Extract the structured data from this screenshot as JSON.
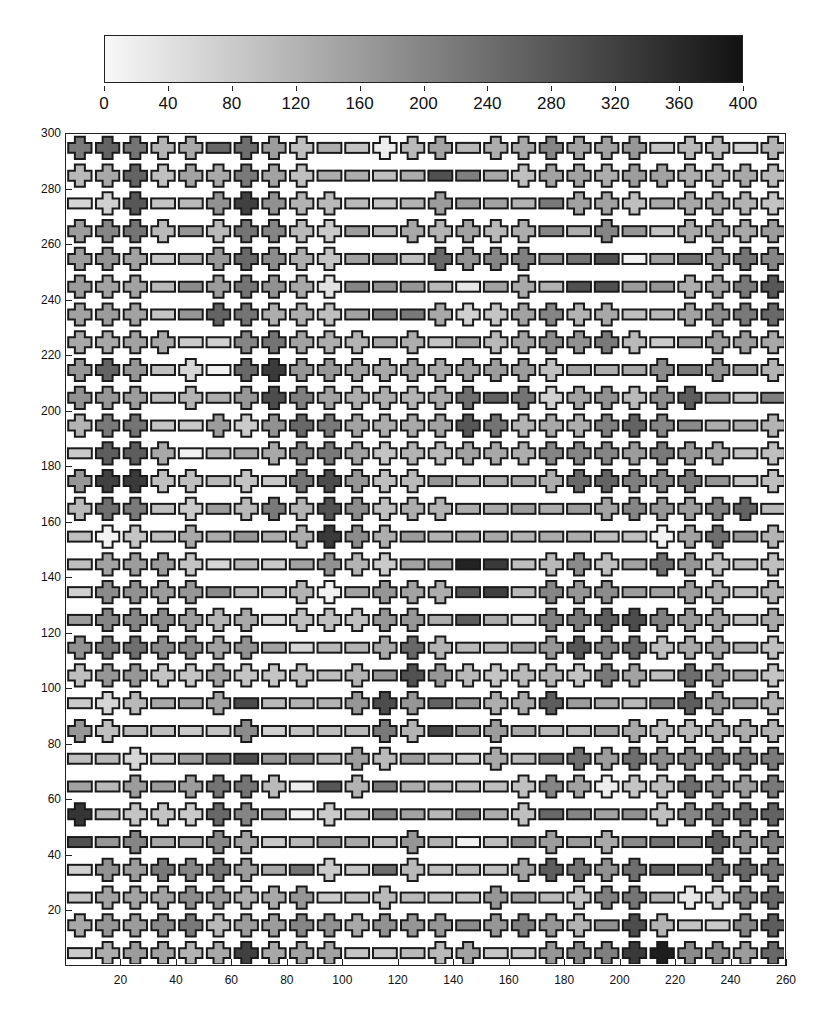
{
  "chart_data": {
    "type": "heatmap",
    "title": "",
    "subtitle": "",
    "xlabel": "",
    "ylabel": "",
    "colorbar": {
      "min": 0,
      "max": 400,
      "ticks": [
        0,
        40,
        80,
        120,
        160,
        200,
        240,
        280,
        320,
        360,
        400
      ],
      "colormap": "white-to-black (halftone gray)",
      "position": "top"
    },
    "x_axis": {
      "range": [
        0,
        260
      ],
      "ticks": [
        20,
        40,
        60,
        80,
        100,
        120,
        140,
        160,
        180,
        200,
        220,
        240,
        260
      ]
    },
    "y_axis": {
      "range": [
        0,
        300
      ],
      "ticks": [
        20,
        40,
        60,
        80,
        100,
        120,
        140,
        160,
        180,
        200,
        220,
        240,
        260,
        280,
        300
      ]
    },
    "grid": false,
    "legend": "none (glyph shape encodes category: c = cross/plus, b = horizontal bar; fill shade encodes value 0-400)",
    "x_centers": [
      5,
      15,
      25,
      35,
      45,
      55,
      65,
      75,
      85,
      95,
      105,
      115,
      125,
      135,
      145,
      155,
      165,
      175,
      185,
      195,
      205,
      215,
      225,
      235,
      245,
      255
    ],
    "y_centers_top_to_bottom": [
      295,
      285,
      275,
      265,
      255,
      245,
      235,
      225,
      215,
      205,
      195,
      185,
      175,
      165,
      155,
      145,
      135,
      125,
      115,
      105,
      95,
      85,
      75,
      65,
      55,
      45,
      35,
      25,
      15,
      5
    ],
    "rows_types": [
      "cccccbcccbbcccbccccccbccbc",
      "cccccccccbbbbbbbccccccccccc",
      "bccbbcccccbbbcbbbbcccbccccb",
      "ccccbcccccbbcccccbbcbbcccc",
      "cccbbcccccbbbccccbbbbbbcccc",
      "cccbbcccccbbbbbbcbbbbbcccc",
      "cccbbcccccbbbcccccccbbcccc",
      "ccccbbcccccbcbbccccccbbcccc",
      "cccbcbccccccccccccbbbcbcb",
      "cccbcbcccccccccbcccccccbbb",
      "cccbbcccccccccccccccccbbb",
      "bcccbbbcccccccccccccccccbc",
      "cccccbcbcccccbbbbccccccbb",
      "cccbcbccccccccbbbbbccccccb",
      "bccbcbbbccccbbbbbbbbbcccb",
      "bccccbbbbcccbbbbbcccbcccb",
      "bccccbbbccbcccbbbcccbbccb",
      "bccccccbcccccbbbbcccccccb",
      "cccccccbbbbcccbbbcccccccb",
      "cccccccccbcbcccccccccbccb",
      "bccbbcbbbbcccbbcccbbbbccb",
      "ccbbbbcbbbbccbbcbbbbcccc",
      "bbcbbbbbbbccbbbcbbcccccccc",
      "bbcbccccbbcbbbbbcccccccccc",
      "cbcccccbbcbbbbbbcbbbbcccc",
      "bbcbbccbbbbbcbbbbcbcbbbcc",
      "bccccccbbcbbcbbbcccccbbcc",
      "bccccccccbbcbbbcbbcccbccc",
      "ccccccccccccccbccccbccbbcc",
      "bcccccccccbbbccbbccccccccc"
    ],
    "values_note": "Approximate shade values (0-400) per cell, row-major top (y=295) to bottom (y=5), estimated from halftone density",
    "values": [
      [
        220,
        260,
        230,
        120,
        140,
        250,
        240,
        160,
        100,
        130,
        90,
        20,
        110,
        150,
        110,
        130,
        140,
        200,
        150,
        150,
        170,
        90,
        110,
        110,
        70,
        120
      ],
      [
        110,
        140,
        260,
        100,
        150,
        140,
        220,
        150,
        100,
        130,
        130,
        100,
        130,
        290,
        210,
        140,
        100,
        150,
        150,
        130,
        160,
        150,
        130,
        120,
        140,
        110
      ],
      [
        60,
        70,
        280,
        90,
        110,
        180,
        320,
        180,
        120,
        110,
        110,
        90,
        120,
        160,
        160,
        150,
        120,
        220,
        150,
        150,
        100,
        140,
        140,
        140,
        120,
        90
      ],
      [
        160,
        200,
        230,
        110,
        170,
        110,
        230,
        200,
        110,
        80,
        160,
        110,
        140,
        120,
        150,
        110,
        130,
        200,
        130,
        200,
        170,
        90,
        140,
        150,
        140,
        160
      ],
      [
        160,
        180,
        150,
        90,
        130,
        170,
        250,
        190,
        130,
        90,
        150,
        200,
        100,
        250,
        180,
        200,
        210,
        190,
        230,
        290,
        10,
        150,
        230,
        170,
        230,
        200
      ],
      [
        160,
        150,
        150,
        110,
        190,
        160,
        230,
        180,
        140,
        40,
        200,
        180,
        170,
        110,
        30,
        150,
        140,
        120,
        290,
        290,
        160,
        170,
        130,
        160,
        220,
        280
      ],
      [
        150,
        160,
        150,
        90,
        170,
        260,
        230,
        130,
        130,
        100,
        150,
        210,
        220,
        140,
        70,
        90,
        150,
        200,
        120,
        140,
        100,
        110,
        150,
        190,
        220,
        250
      ],
      [
        140,
        140,
        150,
        140,
        80,
        70,
        200,
        230,
        150,
        130,
        120,
        140,
        130,
        90,
        150,
        110,
        150,
        190,
        180,
        220,
        110,
        80,
        150,
        160,
        160,
        140
      ],
      [
        170,
        260,
        170,
        100,
        60,
        10,
        250,
        330,
        170,
        170,
        150,
        140,
        150,
        140,
        160,
        160,
        160,
        100,
        150,
        130,
        140,
        190,
        220,
        180,
        170,
        120
      ],
      [
        180,
        170,
        160,
        110,
        120,
        130,
        170,
        300,
        210,
        150,
        130,
        130,
        120,
        140,
        240,
        260,
        230,
        70,
        150,
        180,
        110,
        190,
        270,
        170,
        100,
        210
      ],
      [
        120,
        220,
        230,
        90,
        80,
        160,
        80,
        180,
        250,
        220,
        150,
        130,
        140,
        150,
        280,
        230,
        120,
        140,
        130,
        210,
        260,
        200,
        190,
        130,
        130,
        120
      ],
      [
        80,
        270,
        270,
        140,
        10,
        110,
        140,
        140,
        200,
        220,
        150,
        90,
        120,
        110,
        150,
        140,
        130,
        200,
        200,
        200,
        160,
        220,
        170,
        140,
        90,
        100
      ],
      [
        170,
        320,
        330,
        100,
        100,
        110,
        90,
        80,
        230,
        300,
        170,
        100,
        110,
        170,
        120,
        130,
        140,
        130,
        250,
        260,
        210,
        200,
        220,
        170,
        90,
        100
      ],
      [
        110,
        240,
        220,
        100,
        80,
        160,
        110,
        220,
        120,
        290,
        190,
        100,
        130,
        120,
        130,
        140,
        160,
        130,
        160,
        150,
        200,
        170,
        160,
        210,
        260,
        110
      ],
      [
        100,
        10,
        90,
        100,
        140,
        130,
        170,
        130,
        130,
        330,
        190,
        130,
        160,
        120,
        130,
        140,
        120,
        130,
        130,
        100,
        100,
        10,
        150,
        240,
        170,
        120
      ],
      [
        100,
        150,
        160,
        160,
        90,
        60,
        110,
        80,
        150,
        180,
        120,
        80,
        150,
        160,
        370,
        330,
        100,
        110,
        190,
        100,
        150,
        240,
        170,
        100,
        100,
        100
      ],
      [
        70,
        190,
        180,
        160,
        170,
        190,
        110,
        90,
        120,
        10,
        150,
        170,
        150,
        130,
        280,
        320,
        110,
        200,
        170,
        190,
        160,
        150,
        160,
        130,
        100,
        120
      ],
      [
        160,
        200,
        200,
        190,
        160,
        120,
        140,
        60,
        100,
        100,
        100,
        170,
        170,
        130,
        270,
        130,
        60,
        210,
        220,
        270,
        300,
        210,
        170,
        150,
        100,
        140
      ],
      [
        180,
        220,
        240,
        190,
        190,
        150,
        180,
        150,
        60,
        110,
        120,
        140,
        250,
        120,
        110,
        110,
        150,
        170,
        280,
        210,
        250,
        100,
        140,
        150,
        130,
        100
      ],
      [
        100,
        170,
        170,
        90,
        90,
        150,
        90,
        90,
        100,
        100,
        120,
        170,
        290,
        170,
        110,
        90,
        110,
        120,
        90,
        220,
        150,
        100,
        240,
        170,
        140,
        90
      ],
      [
        80,
        60,
        110,
        140,
        140,
        150,
        300,
        110,
        120,
        120,
        170,
        300,
        170,
        260,
        170,
        130,
        140,
        270,
        160,
        140,
        110,
        210,
        270,
        170,
        160,
        120
      ],
      [
        170,
        100,
        110,
        100,
        80,
        90,
        190,
        70,
        90,
        100,
        110,
        220,
        120,
        310,
        170,
        160,
        140,
        110,
        110,
        150,
        140,
        100,
        110,
        130,
        130,
        120
      ],
      [
        100,
        110,
        60,
        90,
        160,
        240,
        300,
        170,
        200,
        120,
        160,
        110,
        160,
        110,
        80,
        140,
        110,
        230,
        240,
        160,
        240,
        190,
        200,
        230,
        210,
        220
      ],
      [
        150,
        110,
        160,
        160,
        160,
        230,
        230,
        110,
        20,
        280,
        120,
        220,
        130,
        110,
        100,
        100,
        100,
        200,
        150,
        20,
        90,
        100,
        240,
        190,
        160,
        220
      ],
      [
        340,
        110,
        90,
        90,
        80,
        250,
        200,
        150,
        10,
        80,
        100,
        200,
        150,
        110,
        190,
        130,
        100,
        250,
        200,
        150,
        180,
        100,
        200,
        230,
        240,
        260
      ],
      [
        290,
        170,
        200,
        140,
        140,
        200,
        150,
        80,
        110,
        170,
        140,
        110,
        170,
        120,
        10,
        100,
        190,
        160,
        160,
        140,
        190,
        230,
        200,
        270,
        180,
        210
      ],
      [
        70,
        180,
        160,
        220,
        200,
        230,
        160,
        140,
        230,
        80,
        90,
        240,
        110,
        100,
        110,
        100,
        150,
        270,
        230,
        180,
        240,
        260,
        240,
        240,
        250,
        230
      ],
      [
        90,
        150,
        150,
        150,
        190,
        170,
        130,
        140,
        170,
        80,
        100,
        110,
        110,
        90,
        100,
        170,
        160,
        110,
        100,
        210,
        230,
        130,
        30,
        70,
        200,
        250
      ],
      [
        140,
        170,
        160,
        190,
        220,
        110,
        160,
        160,
        200,
        180,
        140,
        180,
        170,
        170,
        190,
        170,
        210,
        170,
        120,
        180,
        300,
        120,
        90,
        80,
        200,
        270
      ],
      [
        80,
        130,
        160,
        150,
        120,
        140,
        320,
        140,
        150,
        150,
        90,
        90,
        110,
        110,
        150,
        90,
        90,
        170,
        200,
        210,
        330,
        380,
        190,
        190,
        160,
        250
      ]
    ]
  }
}
